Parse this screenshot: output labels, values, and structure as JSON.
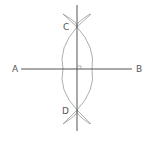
{
  "diagram": {
    "points": {
      "A": {
        "label": "A",
        "x": 21,
        "y": 69
      },
      "B": {
        "label": "B",
        "x": 132,
        "y": 69
      },
      "C": {
        "label": "C",
        "x": 77,
        "y": 27
      },
      "D": {
        "label": "D",
        "x": 77,
        "y": 110
      }
    },
    "segments": [
      {
        "name": "AB",
        "from": "A",
        "to": "B"
      },
      {
        "name": "CD-bisector",
        "from": "top",
        "to": "bottom"
      }
    ],
    "right_angle_marker": true,
    "colors": {
      "line": "#555555",
      "arc": "#999999",
      "label": "#555555",
      "background": "#ffffff"
    }
  }
}
